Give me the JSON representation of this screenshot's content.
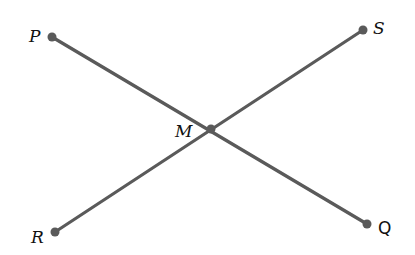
{
  "diagram": {
    "title": "",
    "line_color": "#5a5a5a",
    "points": {
      "P": {
        "label": "P",
        "x": 52,
        "y": 37
      },
      "Q": {
        "label": "Q",
        "x": 367,
        "y": 224
      },
      "R": {
        "label": "R",
        "x": 55,
        "y": 232
      },
      "S": {
        "label": "S",
        "x": 363,
        "y": 30
      },
      "M": {
        "label": "M",
        "x": 211,
        "y": 129
      }
    },
    "segments": [
      {
        "from": "P",
        "to": "Q"
      },
      {
        "from": "R",
        "to": "S"
      }
    ],
    "relations": [
      "Segments PQ and RS intersect at M"
    ]
  }
}
